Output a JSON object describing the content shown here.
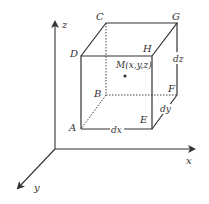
{
  "diagram": {
    "axes": {
      "x": "x",
      "y": "y",
      "z": "z"
    },
    "vertices": {
      "A": "A",
      "B": "B",
      "C": "C",
      "D": "D",
      "E": "E",
      "F": "F",
      "G": "G",
      "H": "H"
    },
    "point_label": "M(x,y,z)",
    "dims": {
      "dx": "dx",
      "dy": "dy",
      "dz": "dz"
    },
    "colors": {
      "line": "#333333",
      "dashed": "#444444"
    }
  }
}
